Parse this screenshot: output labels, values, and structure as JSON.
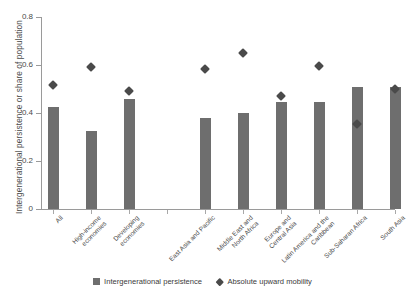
{
  "chart_data": {
    "type": "bar",
    "title": "",
    "xlabel": "",
    "ylabel": "Intergenerational persistence or share of population",
    "ylim": [
      0,
      0.8
    ],
    "yticks": [
      "0",
      "0.2",
      "0.4",
      "0.6",
      "0.8"
    ],
    "ytick_values": [
      0,
      0.2,
      0.4,
      0.6,
      0.8
    ],
    "grid": false,
    "legend_position": "bottom-center",
    "categories": [
      "All",
      "High-income economies",
      "Developing economies",
      "East Asia and Pacific",
      "Middle East and North Africa",
      "Europe and Central Asia",
      "Latin America and the Caribbean",
      "Sub-Saharan Africa",
      "South Asia"
    ],
    "category_lines": [
      [
        "All"
      ],
      [
        "High-income",
        "economies"
      ],
      [
        "Developing",
        "economies"
      ],
      [
        "East Asia and Pacific"
      ],
      [
        "Middle East and",
        "North Africa"
      ],
      [
        "Europe and",
        "Central Asia"
      ],
      [
        "Latin America and the",
        "Caribbean"
      ],
      [
        "Sub-Saharan Africa"
      ],
      [
        "South Asia"
      ]
    ],
    "series": [
      {
        "name": "Intergenerational persistence",
        "type": "bar",
        "color": "#6e6e6e",
        "values": [
          0.425,
          0.325,
          0.46,
          0.38,
          0.4,
          0.445,
          0.445,
          0.51,
          0.51
        ]
      },
      {
        "name": "Absolute upward mobility",
        "type": "scatter",
        "color": "#4a4a4a",
        "marker": "diamond",
        "values": [
          0.515,
          0.59,
          0.49,
          0.585,
          0.65,
          0.47,
          0.595,
          0.355,
          0.5
        ]
      }
    ],
    "group_gap_after_category_index": 2
  },
  "legend": {
    "items": [
      {
        "label": "Intergenerational persistence",
        "marker": "square-swatch"
      },
      {
        "label": "Absolute upward mobility",
        "marker": "diamond-marker"
      }
    ]
  },
  "top_cropped_text": ""
}
